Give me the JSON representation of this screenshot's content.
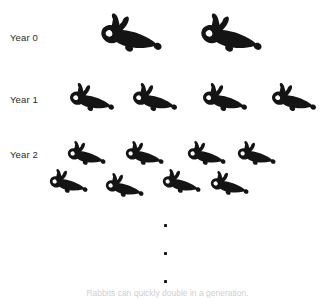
{
  "figure": {
    "title_caption": "Rabbits can quickly double in a generation.",
    "background_color": "#ffffff",
    "silhouette_color": "#141414",
    "label_color": "#2b2b2b",
    "ellipsis_color": "#1b1b1b"
  },
  "rows": [
    {
      "label": "Year 0",
      "label_x": 10,
      "label_y": 33,
      "count": 2,
      "icon_name": "rabbit-silhouette",
      "bunnies": [
        {
          "x": 92,
          "y": 12,
          "w": 72,
          "h": 48
        },
        {
          "x": 192,
          "y": 12,
          "w": 72,
          "h": 48
        }
      ]
    },
    {
      "label": "Year 1",
      "label_x": 10,
      "label_y": 95,
      "count": 4,
      "icon_name": "rabbit-silhouette",
      "bunnies": [
        {
          "x": 63,
          "y": 82,
          "w": 53,
          "h": 35
        },
        {
          "x": 126,
          "y": 82,
          "w": 53,
          "h": 35
        },
        {
          "x": 196,
          "y": 82,
          "w": 53,
          "h": 35
        },
        {
          "x": 265,
          "y": 82,
          "w": 53,
          "h": 35
        }
      ]
    },
    {
      "label": "Year 2",
      "label_x": 10,
      "label_y": 150,
      "count": 8,
      "icon_name": "rabbit-silhouette",
      "bunnies": [
        {
          "x": 62,
          "y": 140,
          "w": 45,
          "h": 30
        },
        {
          "x": 120,
          "y": 140,
          "w": 45,
          "h": 30
        },
        {
          "x": 182,
          "y": 140,
          "w": 45,
          "h": 30
        },
        {
          "x": 232,
          "y": 140,
          "w": 45,
          "h": 30
        },
        {
          "x": 44,
          "y": 168,
          "w": 45,
          "h": 30
        },
        {
          "x": 100,
          "y": 172,
          "w": 45,
          "h": 30
        },
        {
          "x": 157,
          "y": 168,
          "w": 45,
          "h": 30
        },
        {
          "x": 205,
          "y": 170,
          "w": 45,
          "h": 30
        }
      ]
    }
  ],
  "ellipsis": {
    "name": "vertical-ellipsis",
    "dots": [
      {
        "x": 164,
        "y": 224
      },
      {
        "x": 164,
        "y": 252
      },
      {
        "x": 164,
        "y": 280
      }
    ]
  },
  "caption": {
    "text": "Rabbits can quickly double in a generation.",
    "y": 289
  }
}
